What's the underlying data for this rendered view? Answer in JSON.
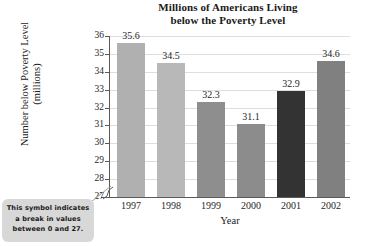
{
  "chart_data": {
    "type": "bar",
    "title": "Millions of Americans Living below the Poverty Level",
    "title_line1": "Millions of Americans Living",
    "title_line2": "below the Poverty Level",
    "xlabel": "Year",
    "ylabel": "Number below Poverty Level (millions)",
    "ylabel_line1": "Number below Poverty Level",
    "ylabel_line2": "(millions)",
    "categories": [
      "1997",
      "1998",
      "1999",
      "2000",
      "2001",
      "2002"
    ],
    "values": [
      35.6,
      34.5,
      32.3,
      31.1,
      32.9,
      34.6
    ],
    "value_labels": [
      "35.6",
      "34.5",
      "32.3",
      "31.1",
      "32.9",
      "34.6"
    ],
    "bar_colors": [
      "#b0b0b0",
      "#b8b8b8",
      "#8e8e8e",
      "#8c8c8c",
      "#333333",
      "#808080"
    ],
    "ylim": [
      27,
      36
    ],
    "yticks": [
      27,
      28,
      29,
      30,
      31,
      32,
      33,
      34,
      35,
      36
    ],
    "ytick_labels": [
      "27",
      "28",
      "29",
      "30",
      "31",
      "32",
      "33",
      "34",
      "35",
      "36"
    ],
    "grid": true,
    "grid_color": "#dedede",
    "legend": null,
    "axis_break": {
      "present": true,
      "between": [
        0,
        27
      ],
      "note_line1": "This symbol indicates",
      "note_line2": "a break in values",
      "note_line3": "between 0 and 27."
    }
  },
  "callout": {
    "line1": "This symbol indicates",
    "line2": "a break in values",
    "line3": "between 0 and 27."
  },
  "icons": {
    "break": "axis-break-zigzag-icon",
    "leader": "callout-leader-line-icon"
  }
}
